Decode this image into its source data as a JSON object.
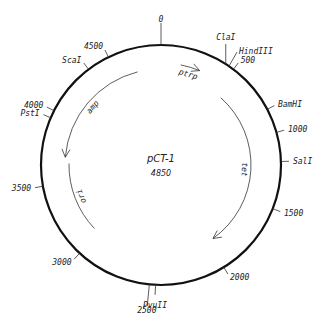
{
  "plasmid": {
    "name": "pCT-1",
    "size_bp": 4850,
    "size_label": "4850"
  },
  "scale_ticks": [
    {
      "position": 0,
      "label": "0"
    },
    {
      "position": 500,
      "label": "500"
    },
    {
      "position": 1000,
      "label": "1000"
    },
    {
      "position": 1500,
      "label": "1500"
    },
    {
      "position": 2000,
      "label": "2000"
    },
    {
      "position": 2500,
      "label": "2500"
    },
    {
      "position": 3000,
      "label": "3000"
    },
    {
      "position": 3500,
      "label": "3500"
    },
    {
      "position": 4000,
      "label": "4000"
    },
    {
      "position": 4500,
      "label": "4500"
    }
  ],
  "restriction_sites": [
    {
      "name": "ClaI",
      "position": 440
    },
    {
      "name": "HindIII",
      "position": 465
    },
    {
      "name": "BamHI",
      "position": 840
    },
    {
      "name": "SalI",
      "position": 1190
    },
    {
      "name": "PvuII",
      "position": 2460
    },
    {
      "name": "PstI",
      "position": 3950
    },
    {
      "name": "ScaI",
      "position": 4350
    }
  ],
  "features": [
    {
      "name": "ptrp",
      "start": 150,
      "end": 300,
      "direction": "clockwise"
    },
    {
      "name": "tet",
      "start": 560,
      "end": 1950,
      "direction": "clockwise"
    },
    {
      "name": "amp",
      "start": 4660,
      "end": 3700,
      "direction": "counterclockwise"
    },
    {
      "name": "ori",
      "start": 3650,
      "end": 3050,
      "direction": "none"
    }
  ]
}
